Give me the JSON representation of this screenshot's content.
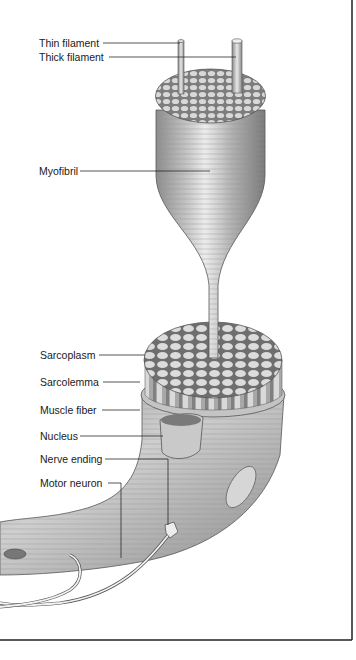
{
  "diagram": {
    "labels": [
      {
        "id": "thin-filament",
        "text": "Thin filament"
      },
      {
        "id": "thick-filament",
        "text": "Thick filament"
      },
      {
        "id": "myofibril",
        "text": "Myofibril"
      },
      {
        "id": "sarcoplasm",
        "text": "Sarcoplasm"
      },
      {
        "id": "sarcolemma",
        "text": "Sarcolemma"
      },
      {
        "id": "muscle-fiber",
        "text": "Muscle fiber"
      },
      {
        "id": "nucleus",
        "text": "Nucleus"
      },
      {
        "id": "nerve-ending",
        "text": "Nerve ending"
      },
      {
        "id": "motor-neuron",
        "text": "Motor neuron"
      }
    ]
  },
  "colors": {
    "ink": "#1a1a1a",
    "border": "#222222",
    "tissue": "#b8b8b8",
    "tissue_dark": "#8a8a8a",
    "highlight": "#e4e4e4"
  }
}
